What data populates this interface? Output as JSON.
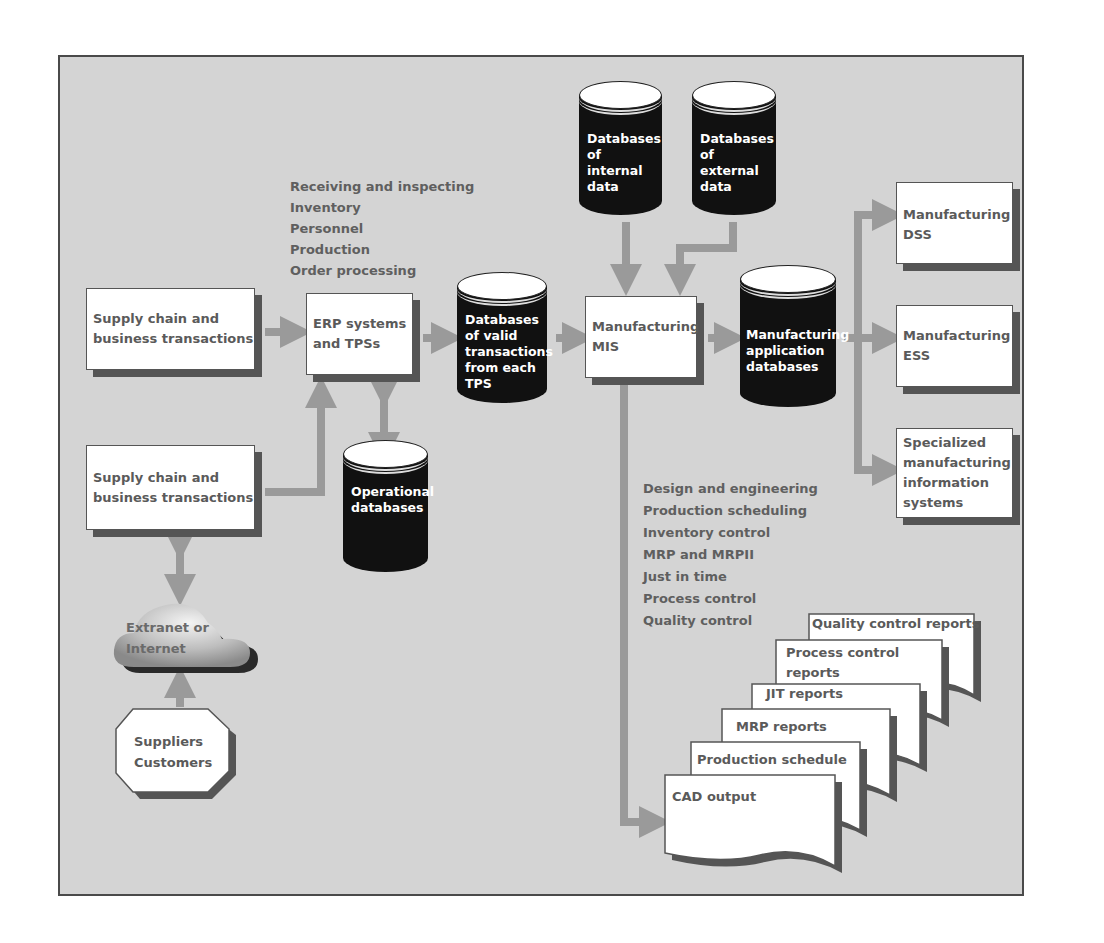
{
  "colors": {
    "background": "#d4d4d4",
    "frame_border": "#4a4a4a",
    "box_fill": "#ffffff",
    "box_shadow": "#555555",
    "text": "#5a5a5a",
    "database_fill": "#111111",
    "database_text": "#ffffff",
    "arrow": "#9a9a9a"
  },
  "inputs": {
    "supply_chain_1": [
      "Supply chain and",
      "business transactions"
    ],
    "supply_chain_2": [
      "Supply chain and",
      "business transactions"
    ],
    "extranet": [
      "Extranet or",
      "Internet"
    ],
    "suppliers": [
      "Suppliers",
      "Customers"
    ]
  },
  "erp": {
    "label": [
      "ERP systems",
      "and TPSs"
    ],
    "functions": [
      "Receiving and inspecting",
      "Inventory",
      "Personnel",
      "Production",
      "Order processing"
    ]
  },
  "databases": {
    "valid_transactions": [
      "Databases",
      "of valid",
      "transactions",
      "from each",
      "TPS"
    ],
    "operational": [
      "Operational",
      "databases"
    ],
    "internal": [
      "Databases",
      "of",
      "internal",
      "data"
    ],
    "external": [
      "Databases",
      "of",
      "external",
      "data"
    ],
    "application": [
      "Manufacturing",
      "application",
      "databases"
    ]
  },
  "mis": {
    "label": [
      "Manufacturing",
      "MIS"
    ],
    "functions": [
      "Design and engineering",
      "Production scheduling",
      "Inventory control",
      "MRP and MRPII",
      "Just in time",
      "Process control",
      "Quality control"
    ]
  },
  "outputs": {
    "dss": [
      "Manufacturing",
      "DSS"
    ],
    "ess": [
      "Manufacturing",
      "ESS"
    ],
    "specialized": [
      "Specialized",
      "manufacturing",
      "information",
      "systems"
    ]
  },
  "reports": [
    {
      "id": "quality",
      "lines": [
        "Quality control reports"
      ]
    },
    {
      "id": "process",
      "lines": [
        "Process control",
        "reports"
      ]
    },
    {
      "id": "jit",
      "lines": [
        "JIT reports"
      ]
    },
    {
      "id": "mrp",
      "lines": [
        "MRP reports"
      ]
    },
    {
      "id": "production",
      "lines": [
        "Production schedule"
      ]
    },
    {
      "id": "cad",
      "lines": [
        "CAD output"
      ]
    }
  ]
}
